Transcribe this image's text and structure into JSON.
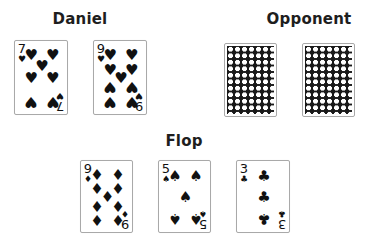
{
  "players": {
    "daniel": {
      "name": "Daniel",
      "cards": [
        {
          "rank": "7",
          "suit": "hearts",
          "suit_symbol": "♥"
        },
        {
          "rank": "9",
          "suit": "hearts",
          "suit_symbol": "♥"
        }
      ]
    },
    "opponent": {
      "name": "Opponent",
      "cards": [
        {
          "face": "down"
        },
        {
          "face": "down"
        }
      ]
    }
  },
  "board": {
    "title": "Flop",
    "cards": [
      {
        "rank": "9",
        "suit": "diamonds",
        "suit_symbol": "♦"
      },
      {
        "rank": "5",
        "suit": "spades",
        "suit_symbol": "♠"
      },
      {
        "rank": "3",
        "suit": "clubs",
        "suit_symbol": "♣"
      }
    ]
  },
  "colors": {
    "suit_color": "#111111",
    "card_border": "#a9a9a9",
    "card_back": "#1a1a1a"
  }
}
